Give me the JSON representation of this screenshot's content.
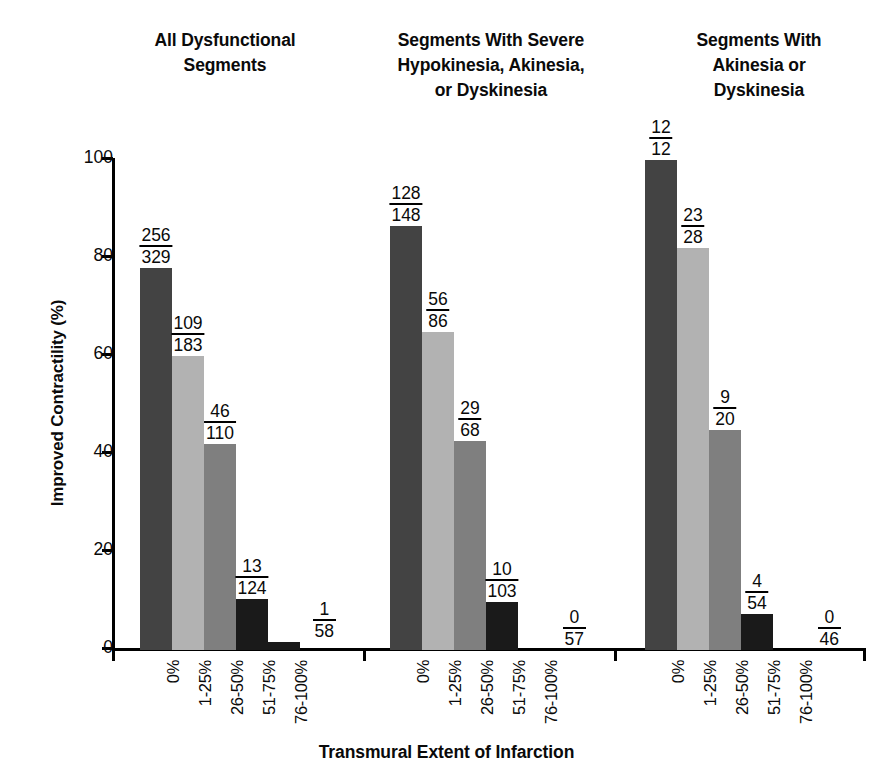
{
  "chart_data": {
    "type": "bar",
    "title": "",
    "xlabel": "Transmural Extent of Infarction",
    "ylabel": "Improved Contractility (%)",
    "ylim": [
      0,
      100
    ],
    "ytick_labels": [
      "100",
      "80",
      "60",
      "40",
      "20",
      "0"
    ],
    "ytick_values": [
      100,
      80,
      60,
      40,
      20,
      0
    ],
    "grid": false,
    "legend": "none",
    "categories": [
      "0%",
      "1-25%",
      "26-50%",
      "51-75%",
      "76-100%"
    ],
    "bar_colors": [
      "#434343",
      "#b2b2b2",
      "#7f7f7f",
      "#1a1a1a",
      "#1a1a1a"
    ],
    "panels": [
      {
        "title": "All Dysfunctional Segments",
        "title_lines": [
          "All Dysfunctional",
          "Segments"
        ],
        "values": [
          78,
          60,
          42,
          10.5,
          1.7
        ],
        "labels": [
          {
            "numerator": "256",
            "denominator": "329"
          },
          {
            "numerator": "109",
            "denominator": "183"
          },
          {
            "numerator": "46",
            "denominator": "110"
          },
          {
            "numerator": "13",
            "denominator": "124"
          },
          {
            "numerator": "1",
            "denominator": "58"
          }
        ]
      },
      {
        "title": "Segments With Severe Hypokinesia, Akinesia, or Dyskinesia",
        "title_lines": [
          "Segments With Severe",
          "Hypokinesia, Akinesia,",
          "or Dyskinesia"
        ],
        "values": [
          86.5,
          65,
          42.6,
          9.7,
          0
        ],
        "labels": [
          {
            "numerator": "128",
            "denominator": "148"
          },
          {
            "numerator": "56",
            "denominator": "86"
          },
          {
            "numerator": "29",
            "denominator": "68"
          },
          {
            "numerator": "10",
            "denominator": "103"
          },
          {
            "numerator": "0",
            "denominator": "57"
          }
        ]
      },
      {
        "title": "Segments With Akinesia or Dyskinesia",
        "title_lines": [
          "Segments With",
          "Akinesia or",
          "Dyskinesia"
        ],
        "values": [
          100,
          82,
          45,
          7.4,
          0
        ],
        "labels": [
          {
            "numerator": "12",
            "denominator": "12"
          },
          {
            "numerator": "23",
            "denominator": "28"
          },
          {
            "numerator": "9",
            "denominator": "20"
          },
          {
            "numerator": "4",
            "denominator": "54"
          },
          {
            "numerator": "0",
            "denominator": "46"
          }
        ]
      }
    ]
  }
}
